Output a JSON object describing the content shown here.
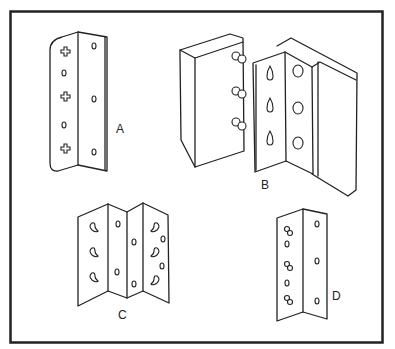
{
  "figure": {
    "frame_color": "#222222",
    "background": "#ffffff"
  },
  "brackets": [
    {
      "id": "A",
      "label": "A",
      "description": "L-bracket with cross-shaped holes on left leaf and round holes on right leaf"
    },
    {
      "id": "B",
      "label": "B",
      "description": "Bracket with keyhole slots mounted between two wood panels with screws"
    },
    {
      "id": "C",
      "label": "C",
      "description": "Double folded bracket with curved slots and round holes"
    },
    {
      "id": "D",
      "label": "D",
      "description": "L-bracket with figure-eight slots and round holes"
    }
  ]
}
